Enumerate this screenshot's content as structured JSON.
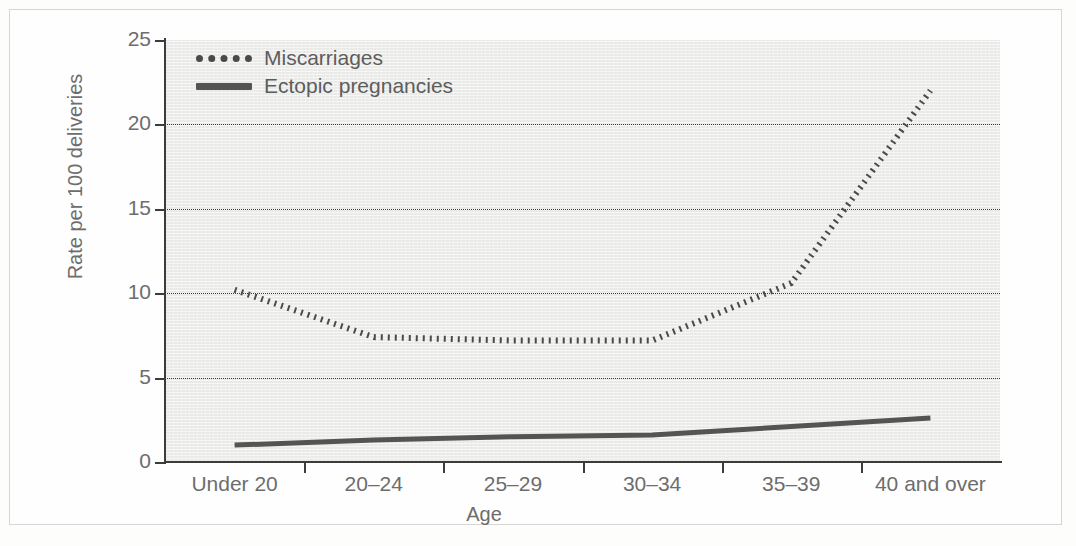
{
  "chart_data": {
    "type": "line",
    "title": "",
    "xlabel": "Age",
    "ylabel": "Rate per 100 deliveries",
    "categories": [
      "Under 20",
      "20–24",
      "25–29",
      "30–34",
      "35–39",
      "40 and over"
    ],
    "yticks": [
      0,
      5,
      10,
      15,
      20,
      25
    ],
    "ylim": [
      0,
      25
    ],
    "grid": true,
    "legend_position": "top-left",
    "series": [
      {
        "name": "Miscarriages",
        "style": "dotted",
        "color": "#4a4a4a",
        "values": [
          10.2,
          7.4,
          7.2,
          7.2,
          10.6,
          22.0
        ]
      },
      {
        "name": "Ectopic pregnancies",
        "style": "solid",
        "color": "#545454",
        "values": [
          1.0,
          1.3,
          1.5,
          1.6,
          2.1,
          2.6
        ]
      }
    ]
  },
  "axes": {
    "y_title": "Rate per 100 deliveries",
    "x_title": "Age",
    "y_tick_labels": [
      "0",
      "5",
      "10",
      "15",
      "20",
      "25"
    ],
    "x_tick_labels": [
      "Under 20",
      "20–24",
      "25–29",
      "30–34",
      "35–39",
      "40 and over"
    ]
  },
  "legend": {
    "items": [
      {
        "label": "Miscarriages",
        "swatch": "dotted-line-swatch"
      },
      {
        "label": "Ectopic pregnancies",
        "swatch": "solid-line-swatch"
      }
    ]
  },
  "caption": {
    "sliver_text": ""
  }
}
